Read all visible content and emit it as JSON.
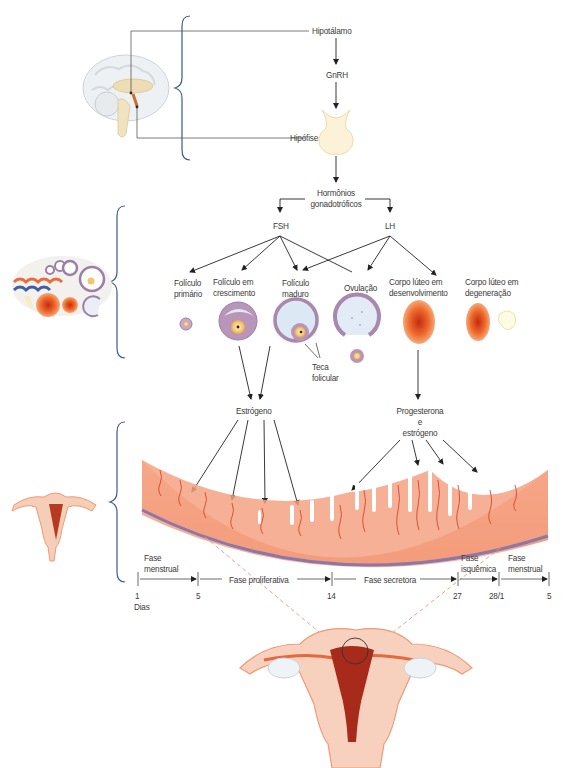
{
  "hypothalamic_axis": {
    "hypothalamus": "Hipotálamo",
    "gnrh": "GnRH",
    "pituitary": "Hipófise"
  },
  "gonadotropins": {
    "title_line1": "Hormônios",
    "title_line2": "gonadotróficos",
    "fsh": "FSH",
    "lh": "LH"
  },
  "ovarian_stages": [
    {
      "line1": "Folículo",
      "line2": "primário"
    },
    {
      "line1": "Folículo em",
      "line2": "crescimento"
    },
    {
      "line1": "Folículo",
      "line2": "maduro"
    },
    {
      "line1": "Ovulação",
      "line2": ""
    },
    {
      "line1": "Corpo lúteo em",
      "line2": "desenvolvimento"
    },
    {
      "line1": "Corpo lúteo em",
      "line2": "degeneração"
    }
  ],
  "theca": {
    "line1": "Teca",
    "line2": "folicular"
  },
  "hormones": {
    "estrogen": "Estrógeno",
    "prog_line1": "Progesterona",
    "prog_line2": "e",
    "prog_line3": "estrógeno"
  },
  "timeline": {
    "phases": [
      {
        "line1": "Fase",
        "line2": "menstrual"
      },
      {
        "line1": "Fase proliferativa",
        "line2": ""
      },
      {
        "line1": "Fase secretora",
        "line2": ""
      },
      {
        "line1": "Fase",
        "line2": "isquêmica"
      },
      {
        "line1": "Fase",
        "line2": "menstrual"
      }
    ],
    "ticks": [
      "1",
      "5",
      "14",
      "27",
      "28/1",
      "5"
    ],
    "unit": "Dias"
  },
  "colors": {
    "brace": "#3d5a8c",
    "line": "#333333",
    "endometrium": "#f08a6a",
    "myometrium": "#8c78a8",
    "vessel": "#d23a1e",
    "follicle": "#9b7fa6",
    "corpus_luteum": "#e8652a",
    "dashed": "#e79a7a"
  }
}
